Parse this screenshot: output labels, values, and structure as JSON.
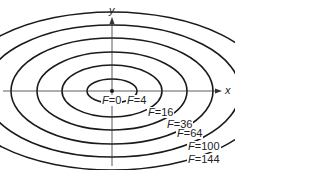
{
  "axes": {
    "x_label": "x",
    "y_label": "y"
  },
  "origin": {
    "cx": 112,
    "cy": 91
  },
  "contours": [
    {
      "label": "F=0",
      "var": "F",
      "value": "0",
      "rx": 0,
      "ry": 0,
      "lx": 101,
      "ly": 95
    },
    {
      "label": "F=4",
      "var": "F",
      "value": "4",
      "rx": 25,
      "ry": 12,
      "lx": 126,
      "ly": 95
    },
    {
      "label": "F=16",
      "var": "F",
      "value": "16",
      "rx": 50,
      "ry": 26,
      "lx": 147,
      "ly": 107
    },
    {
      "label": "F=36",
      "var": "F",
      "value": "36",
      "rx": 75,
      "ry": 39,
      "lx": 166,
      "ly": 119
    },
    {
      "label": "F=64",
      "var": "F",
      "value": "64",
      "rx": 101,
      "ry": 53,
      "lx": 176,
      "ly": 128
    },
    {
      "label": "F=100",
      "var": "F",
      "value": "100",
      "rx": 128,
      "ry": 66,
      "lx": 187,
      "ly": 141
    },
    {
      "label": "F=144",
      "var": "F",
      "value": "144",
      "rx": 156,
      "ry": 79,
      "lx": 187,
      "ly": 154
    }
  ],
  "colors": {
    "line": "#1a1a1a",
    "background": "#ffffff"
  }
}
